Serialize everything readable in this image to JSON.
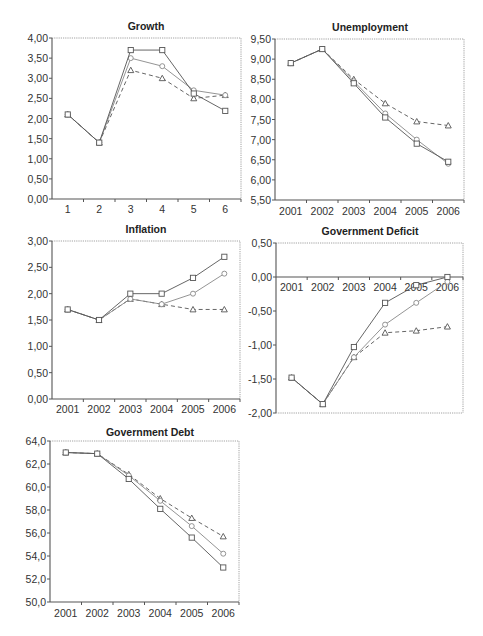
{
  "page": {
    "top_caption_fragment": ""
  },
  "style": {
    "axis_color": "#555555",
    "frame_color": "#8a8a8a",
    "series_square_color": "#555555",
    "series_circle_color": "#888888",
    "series_triangle_color": "#555555",
    "title_color": "#222222",
    "label_color": "#333333"
  },
  "chart_data": [
    {
      "type": "line",
      "title": "Growth",
      "categories": [
        "1",
        "2",
        "3",
        "4",
        "5",
        "6"
      ],
      "ylim": [
        0.0,
        4.0
      ],
      "yticks": [
        "0,00",
        "0,50",
        "1,00",
        "1,50",
        "2,00",
        "2,50",
        "3,00",
        "3,50",
        "4,00"
      ],
      "xlabel": "",
      "ylabel": "",
      "grid": false,
      "legend": "none",
      "series": [
        {
          "name": "square",
          "marker": "square",
          "dash": "solid",
          "values": [
            2.1,
            1.4,
            3.7,
            3.7,
            2.62,
            2.19
          ]
        },
        {
          "name": "circle",
          "marker": "circle",
          "dash": "solid",
          "values": [
            2.1,
            1.4,
            3.5,
            3.3,
            2.7,
            2.58
          ]
        },
        {
          "name": "triangle",
          "marker": "triangle",
          "dash": "dashed",
          "values": [
            2.1,
            1.4,
            3.2,
            3.0,
            2.5,
            2.58
          ]
        }
      ]
    },
    {
      "type": "line",
      "title": "Unemployment",
      "categories": [
        "2001",
        "2002",
        "2003",
        "2004",
        "2005",
        "2006"
      ],
      "ylim": [
        5.5,
        9.5
      ],
      "yticks": [
        "5,50",
        "6,00",
        "6,50",
        "7,00",
        "7,50",
        "8,00",
        "8,50",
        "9,00",
        "9,50"
      ],
      "xlabel": "",
      "ylabel": "",
      "grid": false,
      "legend": "none",
      "series": [
        {
          "name": "square",
          "marker": "square",
          "dash": "solid",
          "values": [
            8.9,
            9.25,
            8.4,
            7.55,
            6.9,
            6.45
          ]
        },
        {
          "name": "circle",
          "marker": "circle",
          "dash": "solid",
          "values": [
            8.9,
            9.25,
            8.45,
            7.65,
            7.0,
            6.4
          ]
        },
        {
          "name": "triangle",
          "marker": "triangle",
          "dash": "dashed",
          "values": [
            8.9,
            9.25,
            8.5,
            7.9,
            7.45,
            7.35
          ]
        }
      ]
    },
    {
      "type": "line",
      "title": "Inflation",
      "categories": [
        "2001",
        "2002",
        "2003",
        "2004",
        "2005",
        "2006"
      ],
      "ylim": [
        0.0,
        3.0
      ],
      "yticks": [
        "0,00",
        "0,50",
        "1,00",
        "1,50",
        "2,00",
        "2,50",
        "3,00"
      ],
      "xlabel": "",
      "ylabel": "",
      "grid": false,
      "legend": "none",
      "series": [
        {
          "name": "square",
          "marker": "square",
          "dash": "solid",
          "values": [
            1.7,
            1.5,
            2.0,
            2.0,
            2.3,
            2.7
          ]
        },
        {
          "name": "circle",
          "marker": "circle",
          "dash": "solid",
          "values": [
            1.7,
            1.5,
            1.9,
            1.8,
            2.0,
            2.38
          ]
        },
        {
          "name": "triangle",
          "marker": "triangle",
          "dash": "dashed",
          "values": [
            1.7,
            1.5,
            1.9,
            1.8,
            1.7,
            1.7
          ]
        }
      ]
    },
    {
      "type": "line",
      "title": "Government Deficit",
      "categories": [
        "2001",
        "2002",
        "2003",
        "2004",
        "2005",
        "2006"
      ],
      "ylim": [
        -2.0,
        0.5
      ],
      "yticks": [
        "-2,00",
        "-1,50",
        "-1,00",
        "-0,50",
        "0,00",
        "0,50"
      ],
      "xlabel": "",
      "ylabel": "",
      "x_axis_at_zero": true,
      "grid": false,
      "legend": "none",
      "series": [
        {
          "name": "square",
          "marker": "square",
          "dash": "solid",
          "values": [
            -1.48,
            -1.87,
            -1.03,
            -0.38,
            -0.12,
            0.0
          ]
        },
        {
          "name": "circle",
          "marker": "circle",
          "dash": "solid",
          "values": [
            -1.48,
            -1.87,
            -1.18,
            -0.7,
            -0.38,
            -0.07
          ]
        },
        {
          "name": "triangle",
          "marker": "triangle",
          "dash": "dashed",
          "values": [
            -1.48,
            -1.87,
            -1.18,
            -0.82,
            -0.79,
            -0.73
          ]
        }
      ]
    },
    {
      "type": "line",
      "title": "Government Debt",
      "categories": [
        "2001",
        "2002",
        "2003",
        "2004",
        "2005",
        "2006"
      ],
      "ylim": [
        50.0,
        64.0
      ],
      "yticks": [
        "50,0",
        "52,0",
        "54,0",
        "56,0",
        "58,0",
        "60,0",
        "62,0",
        "64,0"
      ],
      "xlabel": "",
      "ylabel": "",
      "grid": false,
      "legend": "none",
      "series": [
        {
          "name": "square",
          "marker": "square",
          "dash": "solid",
          "values": [
            63.0,
            62.9,
            60.7,
            58.1,
            55.6,
            53.0
          ]
        },
        {
          "name": "circle",
          "marker": "circle",
          "dash": "solid",
          "values": [
            63.0,
            62.9,
            61.0,
            58.8,
            56.6,
            54.2
          ]
        },
        {
          "name": "triangle",
          "marker": "triangle",
          "dash": "dashed",
          "values": [
            63.0,
            62.9,
            61.1,
            59.0,
            57.3,
            55.7
          ]
        }
      ]
    }
  ],
  "layout_panels": [
    {
      "title_x": 146,
      "title_y": 30,
      "plot": {
        "left": 52,
        "top": 38,
        "right": 241,
        "bottom": 199
      },
      "label_y_off": 14
    },
    {
      "title_x": 370,
      "title_y": 31,
      "plot": {
        "left": 275,
        "top": 39,
        "right": 464,
        "bottom": 200
      },
      "label_y_off": 15
    },
    {
      "title_x": 146,
      "title_y": 233,
      "plot": {
        "left": 52,
        "top": 241,
        "right": 240,
        "bottom": 399
      },
      "label_y_off": 14
    },
    {
      "title_x": 370,
      "title_y": 235,
      "plot": {
        "left": 276,
        "top": 243,
        "right": 463,
        "bottom": 413
      },
      "label_y_off": 14
    },
    {
      "title_x": 150,
      "title_y": 436,
      "plot": {
        "left": 50,
        "top": 441,
        "right": 239,
        "bottom": 602
      },
      "label_y_off": 15
    }
  ]
}
